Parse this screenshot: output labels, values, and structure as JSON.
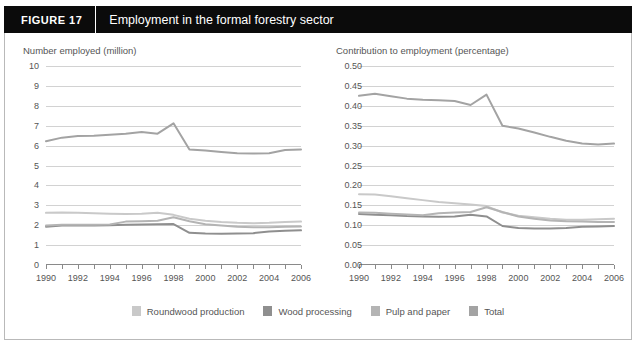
{
  "figure": {
    "label": "FIGURE  17",
    "title": "Employment in the formal forestry sector"
  },
  "colors": {
    "roundwood": "#c9c9c9",
    "wood_processing": "#8f8f8f",
    "pulp_paper": "#b4b4b4",
    "total": "#a3a3a3",
    "grid": "#d2d2d2",
    "axis": "#8a8a8a",
    "header_bg": "#0b0b0b",
    "header_text": "#ffffff",
    "tick_text": "#555555",
    "frame": "#b9b9b9"
  },
  "legend": {
    "position": "bottom-center",
    "items": [
      {
        "label": "Roundwood production",
        "color": "#c9c9c9"
      },
      {
        "label": "Wood processing",
        "color": "#8f8f8f"
      },
      {
        "label": "Pulp and paper",
        "color": "#b4b4b4"
      },
      {
        "label": "Total",
        "color": "#a3a3a3"
      }
    ]
  },
  "chart_data": [
    {
      "type": "line",
      "panel": "left",
      "title": "Number employed (million)",
      "xlabel": "",
      "ylabel": "Number employed (million)",
      "grid": true,
      "legend_position": "bottom-center",
      "x": [
        1990,
        1991,
        1992,
        1993,
        1994,
        1995,
        1996,
        1997,
        1998,
        1999,
        2000,
        2001,
        2002,
        2003,
        2004,
        2005,
        2006
      ],
      "xlim": [
        1990,
        2006
      ],
      "xticks": [
        1990,
        1991,
        1992,
        1993,
        1994,
        1995,
        1996,
        1997,
        1998,
        1999,
        2000,
        2001,
        2002,
        2003,
        2004,
        2005,
        2006
      ],
      "xtick_labels": [
        "1990",
        "",
        "1992",
        "",
        "1994",
        "",
        "1996",
        "",
        "1998",
        "",
        "2000",
        "",
        "2002",
        "",
        "2004",
        "",
        "2006"
      ],
      "ylim": [
        0,
        10
      ],
      "yticks": [
        0,
        1,
        2,
        3,
        4,
        5,
        6,
        7,
        8,
        9,
        10
      ],
      "ytick_labels": [
        "0",
        "1",
        "2",
        "3",
        "4",
        "5",
        "6",
        "7",
        "8",
        "9",
        "10"
      ],
      "series": [
        {
          "name": "Roundwood production",
          "color": "#c9c9c9",
          "values": [
            2.62,
            2.64,
            2.62,
            2.6,
            2.58,
            2.56,
            2.57,
            2.62,
            2.52,
            2.32,
            2.22,
            2.16,
            2.12,
            2.1,
            2.12,
            2.16,
            2.18
          ]
        },
        {
          "name": "Wood processing",
          "color": "#8f8f8f",
          "values": [
            1.92,
            1.98,
            1.99,
            1.99,
            2.0,
            2.02,
            2.03,
            2.05,
            2.06,
            1.62,
            1.58,
            1.57,
            1.58,
            1.6,
            1.68,
            1.72,
            1.74
          ]
        },
        {
          "name": "Pulp and paper",
          "color": "#b4b4b4",
          "values": [
            1.98,
            2.02,
            2.02,
            2.02,
            2.03,
            2.18,
            2.2,
            2.22,
            2.4,
            2.2,
            2.05,
            1.98,
            1.92,
            1.9,
            1.9,
            1.92,
            1.94
          ]
        },
        {
          "name": "Total",
          "color": "#a3a3a3",
          "values": [
            6.22,
            6.4,
            6.48,
            6.5,
            6.55,
            6.6,
            6.68,
            6.6,
            7.12,
            5.8,
            5.75,
            5.68,
            5.62,
            5.6,
            5.62,
            5.78,
            5.8
          ]
        }
      ]
    },
    {
      "type": "line",
      "panel": "right",
      "title": "Contribution to employment (percentage)",
      "xlabel": "",
      "ylabel": "Contribution to employment (percentage)",
      "grid": true,
      "legend_position": "bottom-center",
      "x": [
        1990,
        1991,
        1992,
        1993,
        1994,
        1995,
        1996,
        1997,
        1998,
        1999,
        2000,
        2001,
        2002,
        2003,
        2004,
        2005,
        2006
      ],
      "xlim": [
        1990,
        2006
      ],
      "xticks": [
        1990,
        1991,
        1992,
        1993,
        1994,
        1995,
        1996,
        1997,
        1998,
        1999,
        2000,
        2001,
        2002,
        2003,
        2004,
        2005,
        2006
      ],
      "xtick_labels": [
        "1990",
        "",
        "1992",
        "",
        "1994",
        "",
        "1996",
        "",
        "1998",
        "",
        "2000",
        "",
        "2002",
        "",
        "2004",
        "",
        "2006"
      ],
      "ylim": [
        0.0,
        0.5
      ],
      "yticks": [
        0.0,
        0.05,
        0.1,
        0.15,
        0.2,
        0.25,
        0.3,
        0.35,
        0.4,
        0.45,
        0.5
      ],
      "ytick_labels": [
        "0.00",
        "0.05",
        "0.10",
        "0.15",
        "0.20",
        "0.25",
        "0.30",
        "0.35",
        "0.40",
        "0.45",
        "0.50"
      ],
      "series": [
        {
          "name": "Roundwood production",
          "color": "#c9c9c9",
          "values": [
            0.178,
            0.177,
            0.173,
            0.168,
            0.163,
            0.158,
            0.155,
            0.152,
            0.148,
            0.132,
            0.124,
            0.12,
            0.116,
            0.114,
            0.114,
            0.115,
            0.116
          ]
        },
        {
          "name": "Wood processing",
          "color": "#8f8f8f",
          "values": [
            0.128,
            0.126,
            0.125,
            0.123,
            0.122,
            0.121,
            0.122,
            0.126,
            0.122,
            0.098,
            0.093,
            0.092,
            0.092,
            0.093,
            0.096,
            0.097,
            0.098
          ]
        },
        {
          "name": "Pulp and paper",
          "color": "#b4b4b4",
          "values": [
            0.132,
            0.131,
            0.129,
            0.127,
            0.125,
            0.13,
            0.132,
            0.133,
            0.145,
            0.133,
            0.122,
            0.116,
            0.112,
            0.11,
            0.109,
            0.108,
            0.108
          ]
        },
        {
          "name": "Total",
          "color": "#a3a3a3",
          "values": [
            0.425,
            0.43,
            0.424,
            0.418,
            0.415,
            0.414,
            0.412,
            0.402,
            0.428,
            0.35,
            0.343,
            0.333,
            0.322,
            0.312,
            0.305,
            0.303,
            0.305
          ]
        }
      ]
    }
  ]
}
